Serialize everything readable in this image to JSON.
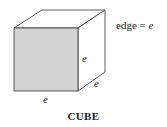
{
  "diagram": {
    "caption": "CUBE",
    "legend": {
      "prefix": "edge = ",
      "variable": "e"
    },
    "edge_labels": {
      "front_right": "e",
      "depth": "e",
      "bottom": "e"
    },
    "colors": {
      "front_face": "#d3d3d3",
      "stroke": "#333333",
      "background": "#ffffff"
    }
  }
}
